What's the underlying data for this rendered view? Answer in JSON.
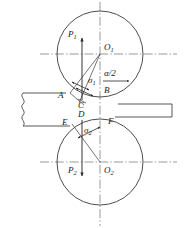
{
  "figure": {
    "type": "engineering-diagram",
    "width": 184,
    "height": 228,
    "background_color": "#ffffff",
    "line_color": "#3a3a3a",
    "centerline_color": "#6b6b6b"
  },
  "labels": {
    "P1": {
      "text": "P",
      "sub": "1"
    },
    "P2": {
      "text": "P",
      "sub": "2"
    },
    "O1": {
      "text": "O",
      "sub": "1"
    },
    "O2": {
      "text": "O",
      "sub": "2"
    },
    "sigma1": {
      "text": "σ",
      "sub": "1"
    },
    "sigma2": {
      "text": "σ",
      "sub": "2"
    },
    "alpha_half": {
      "text": "α/2"
    },
    "A": {
      "text": "A"
    },
    "B": {
      "text": "B"
    },
    "C": {
      "text": "C"
    },
    "D": {
      "text": "D"
    },
    "E": {
      "text": "E"
    },
    "F": {
      "text": "F"
    }
  },
  "geometry": {
    "roll_top": {
      "cx": 100,
      "cy": 54,
      "r": 43
    },
    "roll_bottom": {
      "cx": 100,
      "cy": 162,
      "r": 43
    },
    "vertical_centerline": {
      "x": 100,
      "y1": 2,
      "y2": 226
    },
    "horizontal_centerline_top": {
      "y": 54,
      "x1": 40,
      "x2": 177
    },
    "horizontal_centerline_bottom": {
      "y": 162,
      "x1": 40,
      "x2": 177
    },
    "strip_entry": {
      "x_left": 22,
      "y_top": 93,
      "y_bottom": 126
    },
    "strip_exit": {
      "x_right": 172,
      "y_top": 104,
      "y_bottom": 117
    },
    "points": {
      "A": {
        "x": 66,
        "y": 96
      },
      "B": {
        "x": 117,
        "y": 97
      },
      "C": {
        "x": 82,
        "y": 101
      },
      "D": {
        "x": 82,
        "y": 115
      },
      "E": {
        "x": 70,
        "y": 123
      },
      "F": {
        "x": 114,
        "y": 121
      }
    },
    "vectors": {
      "P1": {
        "x": 82,
        "y_tail": 100,
        "y_head": 37,
        "direction": "up"
      },
      "P2": {
        "x": 82,
        "y_tail": 120,
        "y_head": 177,
        "direction": "down"
      },
      "alpha_arrow": {
        "x_tail": 103,
        "x_head": 128,
        "y": 80,
        "direction": "right"
      }
    },
    "angle": {
      "vertex": {
        "x": 100,
        "y": 54
      },
      "value_label": "α/2"
    }
  }
}
